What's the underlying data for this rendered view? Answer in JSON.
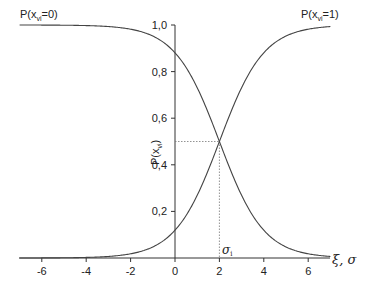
{
  "chart_data": {
    "type": "line",
    "title": "",
    "xlabel": "ξ, σ",
    "ylabel": "P(x_vi)",
    "xlim": [
      -7,
      7
    ],
    "ylim": [
      0,
      1.0
    ],
    "x_ticks": [
      "-6",
      "-4",
      "-2",
      "0",
      "2",
      "4",
      "6"
    ],
    "y_ticks": [
      "0,2",
      "0,4",
      "0,6",
      "0,8",
      "1,0"
    ],
    "grid": false,
    "legend": "inline labels at curve ends",
    "series": [
      {
        "name": "P(x_vi=0)",
        "x": [
          -7,
          -6,
          -5,
          -4,
          -3,
          -2,
          -1,
          0,
          1,
          2,
          3,
          4,
          5,
          6,
          7
        ],
        "values": [
          1.0,
          1.0,
          0.999,
          0.998,
          0.993,
          0.982,
          0.953,
          0.881,
          0.731,
          0.5,
          0.269,
          0.119,
          0.047,
          0.018,
          0.007
        ]
      },
      {
        "name": "P(x_vi=1)",
        "x": [
          -7,
          -6,
          -5,
          -4,
          -3,
          -2,
          -1,
          0,
          1,
          2,
          3,
          4,
          5,
          6,
          7
        ],
        "values": [
          0.0,
          0.0,
          0.001,
          0.002,
          0.007,
          0.018,
          0.047,
          0.119,
          0.269,
          0.5,
          0.731,
          0.881,
          0.953,
          0.982,
          0.993
        ]
      }
    ],
    "annotations": [
      {
        "text": "σ_i",
        "x": 2,
        "y": 0,
        "note": "dotted guide lines from (2, 0.5) to both axes"
      }
    ],
    "crossover": {
      "x": 2,
      "y": 0.5
    }
  },
  "labels": {
    "series0_main": "P(x",
    "series0_sub": "vi",
    "series0_tail": "=0)",
    "series1_main": "P(x",
    "series1_sub": "vi",
    "series1_tail": "=1)",
    "ylabel_main": "P(x",
    "ylabel_sub": "vi",
    "ylabel_tail": ")",
    "sigma_main": "σ",
    "sigma_sub": "i",
    "xlabel": "ξ, σ"
  }
}
